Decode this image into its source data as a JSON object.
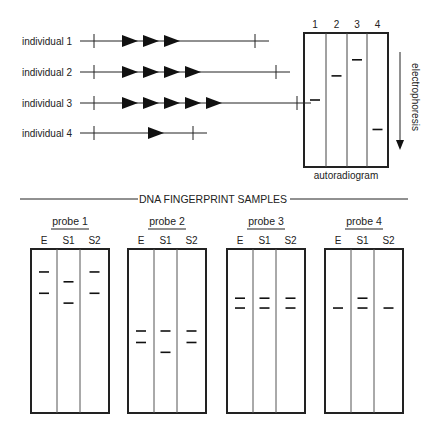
{
  "individuals": [
    {
      "label": "individual 1",
      "repeats": 3
    },
    {
      "label": "individual 2",
      "repeats": 4
    },
    {
      "label": "individual 3",
      "repeats": 5
    },
    {
      "label": "individual 4",
      "repeats": 1
    }
  ],
  "autoradiogram": {
    "caption": "autoradiogram",
    "direction_label": "electrophoresis",
    "lanes": [
      {
        "label": "1",
        "band": 0.5
      },
      {
        "label": "2",
        "band": 0.32
      },
      {
        "label": "3",
        "band": 0.2
      },
      {
        "label": "4",
        "band": 0.72
      }
    ]
  },
  "section_title": "DNA FINGERPRINT SAMPLES",
  "lane_labels": [
    "E",
    "S1",
    "S2"
  ],
  "probes": [
    {
      "label": "probe 1",
      "bands": [
        [
          0.14,
          0.27
        ],
        [
          0.2,
          0.33
        ],
        [
          0.14,
          0.27
        ]
      ]
    },
    {
      "label": "probe 2",
      "bands": [
        [
          0.5,
          0.57
        ],
        [
          0.5,
          0.63
        ],
        [
          0.5,
          0.57
        ]
      ]
    },
    {
      "label": "probe 3",
      "bands": [
        [
          0.3,
          0.36
        ],
        [
          0.3,
          0.36
        ],
        [
          0.3,
          0.36
        ]
      ]
    },
    {
      "label": "probe 4",
      "bands": [
        [
          0.36
        ],
        [
          0.3,
          0.36
        ],
        [
          0.36
        ]
      ]
    }
  ]
}
